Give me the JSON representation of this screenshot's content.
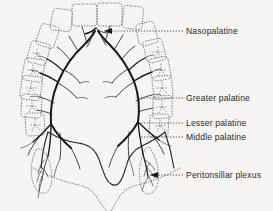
{
  "figure": {
    "background_color": "#f6f5f3",
    "ink_color": "#1a1a1a",
    "dotted_color": "#6e6b66"
  },
  "labels": [
    {
      "id": "nasopalatine",
      "text": "Nasopalatine",
      "x": 186,
      "y": 34,
      "leader": "dashed",
      "arrowhead": true
    },
    {
      "id": "greater-palatine",
      "text": "Greater palatine",
      "x": 186,
      "y": 101,
      "leader": "dashed",
      "arrowhead": false
    },
    {
      "id": "lesser-palatine",
      "text": "Lesser palatine",
      "x": 186,
      "y": 126,
      "leader": "dashed",
      "arrowhead": false
    },
    {
      "id": "middle-palatine",
      "text": "Middle palatine",
      "x": 186,
      "y": 140,
      "leader": "dashed",
      "arrowhead": false
    },
    {
      "id": "peritonsillar-plexus",
      "text": "Peritonsillar plexus",
      "x": 186,
      "y": 178,
      "leader": "dashed",
      "arrowhead": true
    }
  ],
  "structures": [
    {
      "id": "dental-arch",
      "name": "maxillary dental arch",
      "style": "dotted outline"
    },
    {
      "id": "hard-palate",
      "name": "hard palate",
      "style": "blank"
    },
    {
      "id": "soft-palate",
      "name": "soft palate with uvula notch",
      "style": "solid outline"
    },
    {
      "id": "tonsil-left",
      "name": "left palatine tonsil",
      "style": "dotted almond"
    },
    {
      "id": "tonsil-right",
      "name": "right palatine tonsil",
      "style": "dotted almond"
    }
  ]
}
